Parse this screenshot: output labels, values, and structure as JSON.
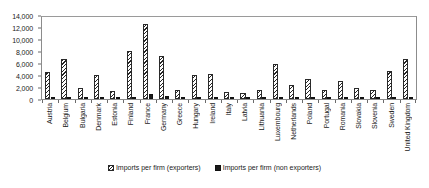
{
  "chart_data": {
    "type": "bar",
    "title": "",
    "subtitle": "",
    "xlabel": "",
    "ylabel": "",
    "ylim": [
      0,
      14000
    ],
    "ytick_labels": [
      "0",
      "2,000",
      "4,000",
      "6,000",
      "8,000",
      "10,000",
      "12,000",
      "14,000"
    ],
    "ytick_values": [
      0,
      2000,
      4000,
      6000,
      8000,
      10000,
      12000,
      14000
    ],
    "grid": false,
    "legend_position": "bottom",
    "categories": [
      "Austria",
      "Belgium",
      "Bulgaria",
      "Denmark",
      "Estonia",
      "Finland",
      "France",
      "Germany",
      "Greece",
      "Hungary",
      "Ireland",
      "Italy",
      "Latvia",
      "Lithuania",
      "Luxembourg",
      "Netherlands",
      "Poland",
      "Portugal",
      "Romania",
      "Slovakia",
      "Slovenia",
      "Sweden",
      "United Kingdom"
    ],
    "series": [
      {
        "name": "Imports per firm (exporters)",
        "pattern": "hatched",
        "values": [
          4650,
          6750,
          1850,
          4050,
          1450,
          8150,
          12800,
          7400,
          1550,
          4050,
          4200,
          1250,
          1100,
          1600,
          5900,
          2450,
          3400,
          1500,
          3000,
          1950,
          1500,
          4700,
          6900
        ]
      },
      {
        "name": "Imports per firm (non exporters)",
        "pattern": "solid",
        "values": [
          260,
          300,
          150,
          230,
          120,
          420,
          900,
          430,
          130,
          260,
          240,
          120,
          110,
          150,
          330,
          200,
          240,
          130,
          220,
          170,
          130,
          280,
          420
        ]
      }
    ]
  },
  "legend": {
    "items": [
      {
        "label": "Imports per firm (exporters)",
        "pattern": "hatched"
      },
      {
        "label": "Imports per firm (non exporters)",
        "pattern": "solid"
      }
    ]
  }
}
